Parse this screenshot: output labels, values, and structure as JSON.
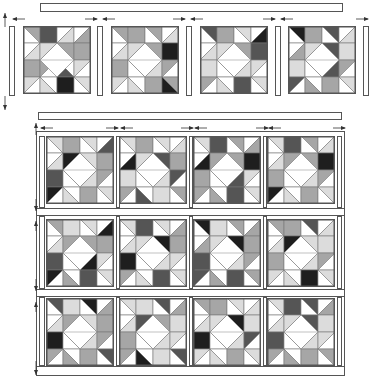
{
  "diagram": {
    "title": "",
    "colors": {
      "white": "#ffffff",
      "light": "#dcdcdc",
      "medium": "#a6a6a6",
      "dark": "#555555",
      "black": "#1e1e1e",
      "outline": "#555555"
    }
  },
  "top_row": {
    "sashing_top": {
      "x": 40,
      "y": 3,
      "w": 303,
      "h": 9
    },
    "side_strips": [
      {
        "x": 9,
        "y": 26,
        "w": 6,
        "h": 70
      },
      {
        "x": 97,
        "y": 26,
        "w": 6,
        "h": 70
      },
      {
        "x": 186,
        "y": 26,
        "w": 6,
        "h": 70
      },
      {
        "x": 275,
        "y": 26,
        "w": 6,
        "h": 70
      },
      {
        "x": 363,
        "y": 26,
        "w": 6,
        "h": 70
      }
    ],
    "blocks": [
      {
        "x": 23,
        "y": 26,
        "size": 68,
        "pattern": 0
      },
      {
        "x": 111,
        "y": 26,
        "size": 68,
        "pattern": 1
      },
      {
        "x": 200,
        "y": 26,
        "size": 68,
        "pattern": 2
      },
      {
        "x": 288,
        "y": 26,
        "size": 68,
        "pattern": 3
      }
    ],
    "arrows_h": [
      {
        "x": 12,
        "y": 19,
        "dir": "left"
      },
      {
        "x": 84,
        "y": 19,
        "dir": "right"
      },
      {
        "x": 102,
        "y": 19,
        "dir": "left"
      },
      {
        "x": 172,
        "y": 19,
        "dir": "right"
      },
      {
        "x": 190,
        "y": 19,
        "dir": "left"
      },
      {
        "x": 262,
        "y": 19,
        "dir": "right"
      },
      {
        "x": 280,
        "y": 19,
        "dir": "left"
      },
      {
        "x": 355,
        "y": 19,
        "dir": "right"
      }
    ],
    "arrows_v": [
      {
        "x": 2,
        "y": 12,
        "len": 14,
        "dir": "up"
      },
      {
        "x": 2,
        "y": 95,
        "len": 14,
        "dir": "down"
      }
    ]
  },
  "middle_strip": {
    "x": 38,
    "y": 112,
    "w": 304,
    "h": 8
  },
  "assembled": {
    "frame": {
      "x": 36,
      "y": 131,
      "w": 309,
      "h": 245
    },
    "row_sashings": [
      {
        "x": 36,
        "y": 208,
        "w": 309,
        "h": 8
      },
      {
        "x": 36,
        "y": 289,
        "w": 309,
        "h": 8
      },
      {
        "x": 36,
        "y": 366,
        "w": 309,
        "h": 10
      }
    ],
    "blocks": [
      {
        "x": 46,
        "y": 136,
        "size": 68,
        "pattern": 4
      },
      {
        "x": 119,
        "y": 136,
        "size": 68,
        "pattern": 5
      },
      {
        "x": 193,
        "y": 136,
        "size": 68,
        "pattern": 6
      },
      {
        "x": 267,
        "y": 136,
        "size": 68,
        "pattern": 7
      },
      {
        "x": 46,
        "y": 219,
        "size": 68,
        "pattern": 8
      },
      {
        "x": 119,
        "y": 219,
        "size": 68,
        "pattern": 9
      },
      {
        "x": 193,
        "y": 219,
        "size": 68,
        "pattern": 10
      },
      {
        "x": 267,
        "y": 219,
        "size": 68,
        "pattern": 11
      },
      {
        "x": 46,
        "y": 298,
        "size": 68,
        "pattern": 12
      },
      {
        "x": 119,
        "y": 298,
        "size": 68,
        "pattern": 13
      },
      {
        "x": 193,
        "y": 298,
        "size": 68,
        "pattern": 14
      },
      {
        "x": 267,
        "y": 298,
        "size": 68,
        "pattern": 15
      }
    ],
    "arrows_h": [
      {
        "x": 40,
        "y": 128,
        "dir": "left"
      },
      {
        "x": 105,
        "y": 128,
        "dir": "right"
      },
      {
        "x": 120,
        "y": 128,
        "dir": "left"
      },
      {
        "x": 180,
        "y": 128,
        "dir": "right"
      },
      {
        "x": 194,
        "y": 128,
        "dir": "left"
      },
      {
        "x": 255,
        "y": 128,
        "dir": "right"
      },
      {
        "x": 268,
        "y": 128,
        "dir": "left"
      },
      {
        "x": 332,
        "y": 128,
        "dir": "right"
      }
    ],
    "arrows_v": [
      {
        "x": 33,
        "y": 120,
        "len": 12,
        "dir": "up"
      },
      {
        "x": 33,
        "y": 196,
        "len": 12,
        "dir": "down"
      },
      {
        "x": 33,
        "y": 216,
        "len": 10,
        "dir": "up"
      },
      {
        "x": 33,
        "y": 276,
        "len": 12,
        "dir": "down"
      },
      {
        "x": 33,
        "y": 297,
        "len": 10,
        "dir": "up"
      },
      {
        "x": 33,
        "y": 360,
        "len": 14,
        "dir": "down"
      }
    ]
  },
  "patterns": [
    [
      [
        "tl:medium/white",
        "sq:dark",
        "tr:white/light",
        "tr:white/medium"
      ],
      [
        "tr:white/light",
        "tr:light/medium",
        "tl:medium/white",
        "sq:medium"
      ],
      [
        "sq:medium",
        "tr:medium/white",
        "tl:white/dark",
        "tr:light/white"
      ],
      [
        "tr:light/white",
        "tl:white/light",
        "sq:black",
        "tl:light/white"
      ]
    ],
    [
      [
        "tl:medium/white",
        "sq:medium",
        "tl:medium/white",
        "tr:white/light"
      ],
      [
        "tr:white/light",
        "tr:light/medium",
        "tl:medium/white",
        "sq:black"
      ],
      [
        "sq:medium",
        "tl:black/white",
        "tr:white/light",
        "tr:medium/white"
      ],
      [
        "tr:light/white",
        "tl:white/light",
        "sq:medium",
        "tl:medium/black"
      ]
    ],
    [
      [
        "tl:dark/white",
        "sq:medium",
        "tl:light/white",
        "tr:white/black"
      ],
      [
        "tr:white/light",
        "tr:light/medium",
        "tl:medium/white",
        "sq:dark"
      ],
      [
        "sq:light",
        "tl:black/white",
        "tr:white/light",
        "tr:light/white"
      ],
      [
        "tr:medium/white",
        "tl:white/light",
        "sq:dark",
        "tl:light/white"
      ]
    ],
    [
      [
        "tl:black/white",
        "sq:medium",
        "tl:dark/white",
        "tr:white/light"
      ],
      [
        "tr:white/medium",
        "tr:light/medium",
        "tl:dark/white",
        "sq:light"
      ],
      [
        "sq:light",
        "tl:light/white",
        "tr:white/dark",
        "tr:medium/white"
      ],
      [
        "tr:dark/white",
        "tl:white/medium",
        "sq:medium",
        "tl:light/white"
      ]
    ],
    [
      [
        "tl:light/white",
        "sq:medium",
        "tl:light/white",
        "tr:white/dark"
      ],
      [
        "tr:white/light",
        "tr:black/medium",
        "tl:light/white",
        "sq:medium"
      ],
      [
        "sq:dark",
        "tl:medium/white",
        "tr:white/light",
        "tr:medium/white"
      ],
      [
        "tr:black/white",
        "tl:white/light",
        "sq:medium",
        "tl:light/white"
      ]
    ],
    [
      [
        "tl:light/white",
        "sq:medium",
        "tl:light/white",
        "tr:white/light"
      ],
      [
        "tr:white/black",
        "tr:light/medium",
        "tl:dark/white",
        "sq:medium"
      ],
      [
        "sq:light",
        "tl:medium/white",
        "tr:white/light",
        "tr:dark/white"
      ],
      [
        "tr:medium/white",
        "tl:white/dark",
        "sq:light",
        "tl:medium/white"
      ]
    ],
    [
      [
        "tl:light/white",
        "sq:dark",
        "tl:medium/white",
        "tr:white/medium"
      ],
      [
        "tr:white/black",
        "tr:medium/light",
        "tl:medium/white",
        "sq:black"
      ],
      [
        "sq:medium",
        "tl:light/white",
        "tr:white/dark",
        "tr:light/white"
      ],
      [
        "tr:medium/white",
        "tl:white/medium",
        "sq:dark",
        "tl:light/white"
      ]
    ],
    [
      [
        "tl:light/white",
        "sq:dark",
        "tl:medium/white",
        "tr:white/light"
      ],
      [
        "tr:white/light",
        "tr:medium/light",
        "tl:medium/white",
        "sq:black"
      ],
      [
        "sq:medium",
        "tl:light/white",
        "tr:white/light",
        "tr:medium/white"
      ],
      [
        "tr:black/white",
        "tl:white/light",
        "sq:medium",
        "tl:light/white"
      ]
    ],
    [
      [
        "tl:medium/white",
        "sq:light",
        "tl:light/white",
        "tr:white/black"
      ],
      [
        "tr:white/light",
        "tr:medium/light",
        "tl:medium/white",
        "sq:medium"
      ],
      [
        "sq:dark",
        "tl:medium/white",
        "tr:white/black",
        "tr:light/white"
      ],
      [
        "tr:black/white",
        "tl:white/medium",
        "sq:dark",
        "tl:light/white"
      ]
    ],
    [
      [
        "tl:light/white",
        "sq:dark",
        "tl:light/white",
        "tr:white/medium"
      ],
      [
        "tr:white/light",
        "tr:light/medium",
        "tl:black/white",
        "sq:medium"
      ],
      [
        "sq:black",
        "tl:light/white",
        "tr:white/light",
        "tr:light/white"
      ],
      [
        "tr:medium/white",
        "tl:white/light",
        "sq:dark",
        "tl:light/white"
      ]
    ],
    [
      [
        "tl:black/white",
        "sq:light",
        "tl:medium/white",
        "tr:white/medium"
      ],
      [
        "tr:white/medium",
        "tr:light/medium",
        "tl:black/white",
        "sq:medium"
      ],
      [
        "sq:dark",
        "tl:medium/white",
        "tr:white/light",
        "tr:medium/white"
      ],
      [
        "tr:dark/white",
        "tl:white/medium",
        "sq:dark",
        "tl:medium/white"
      ]
    ],
    [
      [
        "tl:medium/white",
        "sq:medium",
        "tl:dark/white",
        "tr:white/light"
      ],
      [
        "tr:white/light",
        "tr:black/light",
        "tl:light/white",
        "sq:light"
      ],
      [
        "sq:medium",
        "tl:dark/white",
        "tr:white/light",
        "tr:medium/white"
      ],
      [
        "tr:light/white",
        "tl:white/light",
        "sq:black",
        "tl:light/white"
      ]
    ],
    [
      [
        "tl:dark/white",
        "sq:light",
        "tl:black/white",
        "tr:white/medium"
      ],
      [
        "tr:white/light",
        "tr:medium/light",
        "tl:light/white",
        "sq:medium"
      ],
      [
        "sq:black",
        "tl:light/white",
        "tr:white/light",
        "tr:medium/white"
      ],
      [
        "tr:medium/white",
        "tl:white/medium",
        "sq:medium",
        "tl:dark/white"
      ]
    ],
    [
      [
        "tl:light/white",
        "sq:light",
        "tl:dark/white",
        "tr:white/medium"
      ],
      [
        "tr:white/light",
        "tr:dark/light",
        "tl:medium/white",
        "sq:light"
      ],
      [
        "sq:medium",
        "tl:light/white",
        "tr:white/light",
        "tr:light/white"
      ],
      [
        "tr:medium/white",
        "tl:white/black",
        "sq:light",
        "tl:dark/white"
      ]
    ],
    [
      [
        "tl:medium/white",
        "sq:medium",
        "tl:light/white",
        "tr:white/light"
      ],
      [
        "tr:white/light",
        "tr:light/medium",
        "tl:black/white",
        "sq:light"
      ],
      [
        "sq:black",
        "tl:light/white",
        "tr:white/light",
        "tr:dark/white"
      ],
      [
        "tr:light/white",
        "tl:white/light",
        "sq:medium",
        "tl:light/white"
      ]
    ],
    [
      [
        "tl:light/white",
        "sq:dark",
        "tl:dark/white",
        "tr:white/medium"
      ],
      [
        "tr:white/light",
        "tr:light/medium",
        "tl:dark/white",
        "sq:light"
      ],
      [
        "sq:dark",
        "tl:black/white",
        "tr:white/light",
        "tr:light/white"
      ],
      [
        "tr:medium/white",
        "tl:white/medium",
        "sq:medium",
        "tl:medium/white"
      ]
    ]
  ]
}
